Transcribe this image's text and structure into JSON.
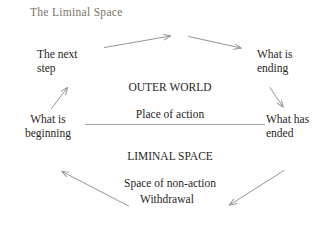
{
  "diagram": {
    "title": "The Liminal Space",
    "title_color": "#7c7268",
    "text_color": "#272625",
    "line_color": "#8e8e92",
    "background": "#ffffff",
    "labels": {
      "next_step": "The next\nstep",
      "what_is_beginning": "What is\nbeginning",
      "what_is_ending": "What is\nending",
      "what_has_ended": "What has\nended",
      "withdrawal": "Withdrawal"
    },
    "blocks": {
      "outer_world_heading": "OUTER WORLD",
      "outer_world_sub": "Place of action",
      "liminal_space_heading": "LIMINAL SPACE",
      "liminal_space_sub": "Space of non-action"
    },
    "arrows": [
      {
        "name": "arrow-beginning-to-next-step",
        "direction": "up-right"
      },
      {
        "name": "arrow-next-step-to-outer-world",
        "direction": "up-right"
      },
      {
        "name": "arrow-outer-world-to-ending",
        "direction": "down-right"
      },
      {
        "name": "arrow-ending-to-ended",
        "direction": "down-right"
      },
      {
        "name": "arrow-ended-to-withdrawal",
        "direction": "down-left"
      },
      {
        "name": "arrow-withdrawal-to-beginning",
        "direction": "up-left"
      }
    ],
    "divider": {
      "name": "liminal-divider-line"
    }
  }
}
